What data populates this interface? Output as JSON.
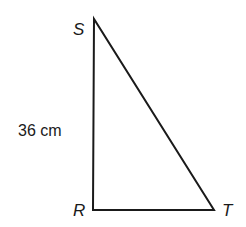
{
  "diagram": {
    "type": "right-triangle",
    "vertices": [
      {
        "label": "S",
        "x": 94,
        "y": 20
      },
      {
        "label": "R",
        "x": 93,
        "y": 210
      },
      {
        "label": "T",
        "x": 214,
        "y": 210
      }
    ],
    "sides": [
      {
        "from": "S",
        "to": "R",
        "length_label": "36 cm"
      },
      {
        "from": "R",
        "to": "T",
        "length_label": ""
      },
      {
        "from": "S",
        "to": "T",
        "length_label": ""
      }
    ],
    "labels": {
      "S": "S",
      "R": "R",
      "T": "T",
      "SR_length": "36 cm"
    },
    "stroke_color": "#1a1a1a",
    "background_color": "#ffffff"
  }
}
